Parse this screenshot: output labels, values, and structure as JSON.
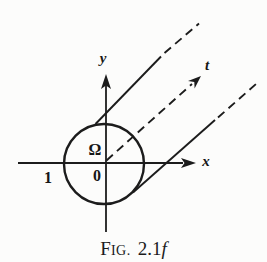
{
  "figure": {
    "labels": {
      "x_axis": "x",
      "y_axis": "y",
      "origin": "0",
      "unit_point": "1",
      "region": "Ω",
      "direction": "t"
    },
    "caption": {
      "head": "F",
      "small_caps": "IG.",
      "number": "2.1",
      "suffix": "f"
    },
    "colors": {
      "ink": "#1c1c1c",
      "background": "#fcfcfb"
    }
  }
}
